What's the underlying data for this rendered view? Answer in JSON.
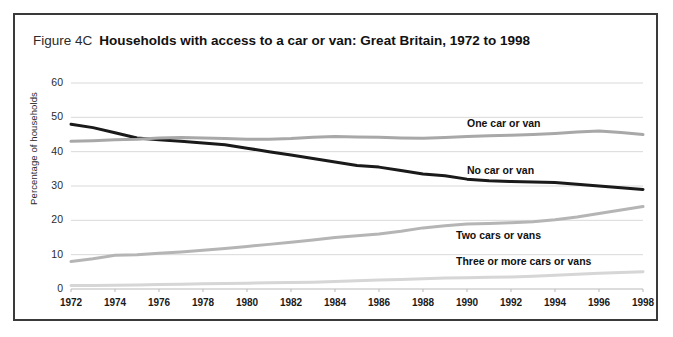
{
  "figure": {
    "number": "Figure 4C",
    "title": "Households with access to a car or van:  Great Britain, 1972 to 1998"
  },
  "chart_data": {
    "type": "line",
    "title": "Households with access to a car or van:  Great Britain, 1972 to 1998",
    "xlabel": "",
    "ylabel": "Percentage of households",
    "xlim": [
      1972,
      1998
    ],
    "ylim": [
      0,
      60
    ],
    "ytick_labels": [
      "0",
      "10",
      "20",
      "30",
      "40",
      "50",
      "60"
    ],
    "yticks": [
      0,
      10,
      20,
      30,
      40,
      50,
      60
    ],
    "xtick_labels": [
      "1972",
      "1974",
      "1976",
      "1978",
      "1980",
      "1982",
      "1984",
      "1986",
      "1988",
      "1990",
      "1992",
      "1994",
      "1996",
      "1998"
    ],
    "xticks": [
      1972,
      1974,
      1976,
      1978,
      1980,
      1982,
      1984,
      1986,
      1988,
      1990,
      1992,
      1994,
      1996,
      1998
    ],
    "grid": true,
    "legend": "inline-labels",
    "x": [
      1972,
      1973,
      1974,
      1975,
      1976,
      1977,
      1978,
      1979,
      1980,
      1981,
      1982,
      1983,
      1984,
      1985,
      1986,
      1987,
      1988,
      1989,
      1990,
      1991,
      1992,
      1993,
      1994,
      1995,
      1996,
      1997,
      1998
    ],
    "series": [
      {
        "name": "No car or van",
        "color": "#1a1a1a",
        "values": [
          48,
          47,
          45.5,
          44,
          43.5,
          43,
          42.5,
          42,
          41,
          40,
          39,
          38,
          37,
          36,
          35.5,
          34.5,
          33.5,
          33,
          32,
          31.5,
          31.3,
          31.2,
          31,
          30.5,
          30,
          29.5,
          29
        ]
      },
      {
        "name": "One car or van",
        "color": "#a8a8a8",
        "values": [
          43,
          43.2,
          43.5,
          43.6,
          44,
          44.1,
          44,
          43.8,
          43.6,
          43.6,
          43.8,
          44.2,
          44.4,
          44.3,
          44.2,
          44,
          43.9,
          44.1,
          44.4,
          44.6,
          44.8,
          45,
          45.3,
          45.7,
          46,
          45.6,
          45
        ]
      },
      {
        "name": "Two cars or vans",
        "color": "#b5b5b5",
        "values": [
          8,
          8.8,
          9.8,
          10,
          10.4,
          10.8,
          11.3,
          11.8,
          12.4,
          13,
          13.6,
          14.3,
          15,
          15.5,
          16,
          16.8,
          17.8,
          18.4,
          18.9,
          19.1,
          19.3,
          19.6,
          20.2,
          21,
          22,
          23,
          24
        ]
      },
      {
        "name": "Three or more cars or vans",
        "color": "#d6d6d6",
        "values": [
          1,
          1.05,
          1.1,
          1.2,
          1.3,
          1.4,
          1.5,
          1.6,
          1.7,
          1.8,
          1.9,
          2,
          2.2,
          2.4,
          2.6,
          2.8,
          3,
          3.2,
          3.3,
          3.4,
          3.5,
          3.7,
          4,
          4.3,
          4.6,
          4.8,
          5
        ]
      }
    ],
    "annotations": [
      {
        "text": "One car or van",
        "x": 1990,
        "y": 48
      },
      {
        "text": "No car or van",
        "x": 1990,
        "y": 34.5
      },
      {
        "text": "Two cars or vans",
        "x": 1989.5,
        "y": 15.5
      },
      {
        "text": "Three or more cars or vans",
        "x": 1989.5,
        "y": 8
      }
    ]
  }
}
